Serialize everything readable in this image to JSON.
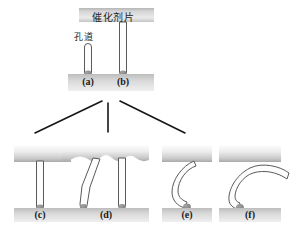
{
  "figure": {
    "title_bar_label": "催化剂片",
    "pore_label": "孔道",
    "background_color": "#ffffff",
    "slab_color_light": "#f2f2f2",
    "slab_color_dark": "#a8a8a8",
    "tube_outline_color": "#4d4d4d",
    "tube_fill_color": "#fdfdfd",
    "cap_color": "#8c8c8c",
    "connector_line_color": "#161616"
  },
  "top_group": {
    "name": "catalyst-slice-overview",
    "panels": [
      {
        "id": "a",
        "label": "(a)",
        "description": "short-pore-channel"
      },
      {
        "id": "b",
        "label": "(b)",
        "description": "through-pore-channel"
      }
    ]
  },
  "connectors": {
    "count": 3,
    "labels": [
      "branch-left",
      "branch-center",
      "branch-right"
    ]
  },
  "bottom_group": {
    "name": "pore-variants",
    "panels": [
      {
        "id": "c",
        "label": "(c)",
        "description": "straight-pore"
      },
      {
        "id": "d",
        "label": "(d)",
        "description": "bent-pore-pair-rough-surface"
      },
      {
        "id": "e",
        "label": "(e)",
        "description": "curved-pore"
      },
      {
        "id": "f",
        "label": "(f)",
        "description": "hooked-pore-open-end"
      }
    ]
  }
}
